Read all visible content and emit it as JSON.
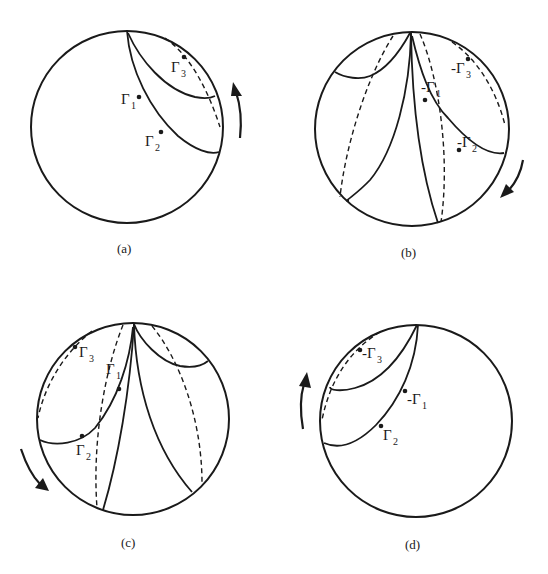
{
  "figure": {
    "panels": [
      {
        "id": "a",
        "caption": "(a)",
        "rotation_arrow": "counterclockwise-up (right side)",
        "points": [
          {
            "label": "Γ",
            "sub": "1",
            "prefix": ""
          },
          {
            "label": "Γ",
            "sub": "2",
            "prefix": ""
          },
          {
            "label": "Γ",
            "sub": "3",
            "prefix": ""
          }
        ]
      },
      {
        "id": "b",
        "caption": "(b)",
        "rotation_arrow": "clockwise-down (right side)",
        "points": [
          {
            "label": "Γ",
            "sub": "1",
            "prefix": "-"
          },
          {
            "label": "Γ",
            "sub": "2",
            "prefix": "-"
          },
          {
            "label": "Γ",
            "sub": "3",
            "prefix": "-"
          }
        ]
      },
      {
        "id": "c",
        "caption": "(c)",
        "rotation_arrow": "down-right (left side)",
        "points": [
          {
            "label": "Γ",
            "sub": "1",
            "prefix": ""
          },
          {
            "label": "Γ",
            "sub": "2",
            "prefix": ""
          },
          {
            "label": "Γ",
            "sub": "3",
            "prefix": ""
          }
        ]
      },
      {
        "id": "d",
        "caption": "(d)",
        "rotation_arrow": "up (left side)",
        "points": [
          {
            "label": "Γ",
            "sub": "1",
            "prefix": "-"
          },
          {
            "label": "Γ",
            "sub": "2",
            "prefix": ""
          },
          {
            "label": "Γ",
            "sub": "3",
            "prefix": "-"
          }
        ]
      }
    ]
  }
}
